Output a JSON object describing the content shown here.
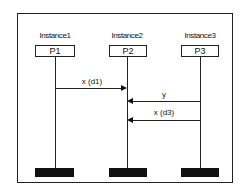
{
  "diagram": {
    "type": "sequence-diagram",
    "instances": [
      {
        "label": "Instance1",
        "process": "P1",
        "x": 55
      },
      {
        "label": "Instance2",
        "process": "P2",
        "x": 127
      },
      {
        "label": "Instance3",
        "process": "P3",
        "x": 200
      }
    ],
    "messages": [
      {
        "label": "x (d1)",
        "from": "P1",
        "to": "P2",
        "direction": "right",
        "y": 88
      },
      {
        "label": "y",
        "from": "P3",
        "to": "P2",
        "direction": "left",
        "y": 101
      },
      {
        "label": "x (d3)",
        "from": "P3",
        "to": "P2",
        "direction": "left",
        "y": 120
      }
    ],
    "colors": {
      "line": "#222222",
      "end_bar": "#111111",
      "background": "#ffffff"
    }
  }
}
